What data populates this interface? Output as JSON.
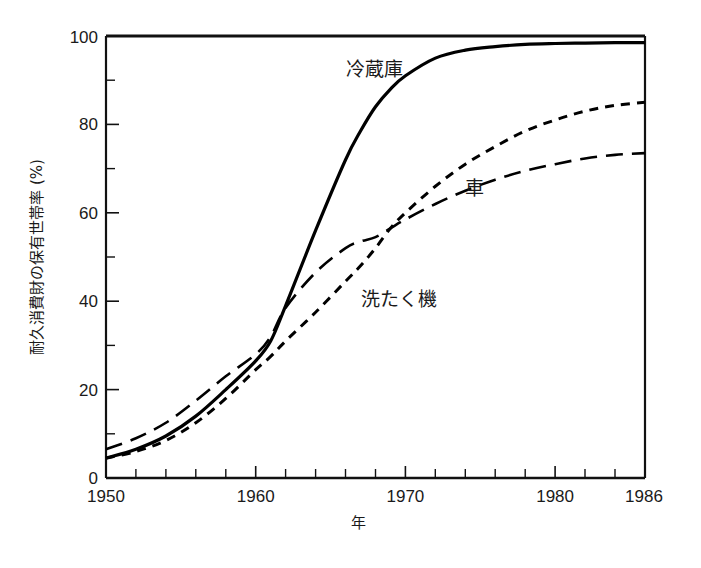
{
  "chart_data": {
    "type": "line",
    "title": "",
    "subtitle": "",
    "xlabel": "年",
    "ylabel": "耐久消費財の保有世帯率 (%)",
    "xlim": [
      1950,
      1986
    ],
    "ylim": [
      0,
      100
    ],
    "grid": false,
    "legend_position": "inline-annotations",
    "x_tick_labels": [
      "1950",
      "1960",
      "1970",
      "1980",
      "1986"
    ],
    "x_tick_values": [
      1950,
      1960,
      1970,
      1980,
      1986
    ],
    "x_minor_tick_step": 2,
    "y_tick_labels": [
      "0",
      "20",
      "40",
      "60",
      "80",
      "100"
    ],
    "y_tick_values": [
      0,
      20,
      40,
      60,
      80,
      100
    ],
    "y_minor_tick_step": 10,
    "x": [
      1950,
      1952,
      1954,
      1956,
      1958,
      1960,
      1961,
      1962,
      1964,
      1966,
      1967,
      1968,
      1969,
      1970,
      1972,
      1974,
      1976,
      1978,
      1980,
      1982,
      1984,
      1986
    ],
    "series": [
      {
        "name": "冷蔵庫",
        "label": "冷蔵庫",
        "line_style": "solid",
        "color": "#000000",
        "annotation": {
          "text": "冷蔵庫",
          "x": 1966,
          "y": 91
        },
        "values": [
          4.5,
          6.5,
          9.5,
          14.0,
          20.0,
          26.5,
          31.0,
          39.0,
          56.0,
          72.0,
          78.5,
          84.0,
          88.0,
          91.0,
          95.0,
          96.8,
          97.6,
          98.1,
          98.3,
          98.4,
          98.5,
          98.5
        ]
      },
      {
        "name": "車",
        "label": "車",
        "line_style": "short-dash",
        "color": "#000000",
        "annotation": {
          "text": "車",
          "x": 1974,
          "y": 64
        },
        "values": [
          4.5,
          6.0,
          8.5,
          12.5,
          18.0,
          24.5,
          27.5,
          31.0,
          37.5,
          44.5,
          48.0,
          52.0,
          56.5,
          60.0,
          66.0,
          71.0,
          75.0,
          78.5,
          81.0,
          83.0,
          84.3,
          85.0
        ]
      },
      {
        "name": "洗たく機",
        "label": "洗たく機",
        "line_style": "long-dash",
        "color": "#000000",
        "annotation": {
          "text": "洗たく機",
          "x": 1967,
          "y": 39
        },
        "values": [
          6.5,
          9.0,
          12.5,
          17.5,
          23.0,
          28.0,
          32.0,
          38.5,
          46.5,
          52.0,
          53.5,
          54.5,
          56.5,
          58.5,
          62.0,
          65.0,
          67.5,
          69.5,
          71.0,
          72.3,
          73.1,
          73.5
        ]
      }
    ]
  }
}
